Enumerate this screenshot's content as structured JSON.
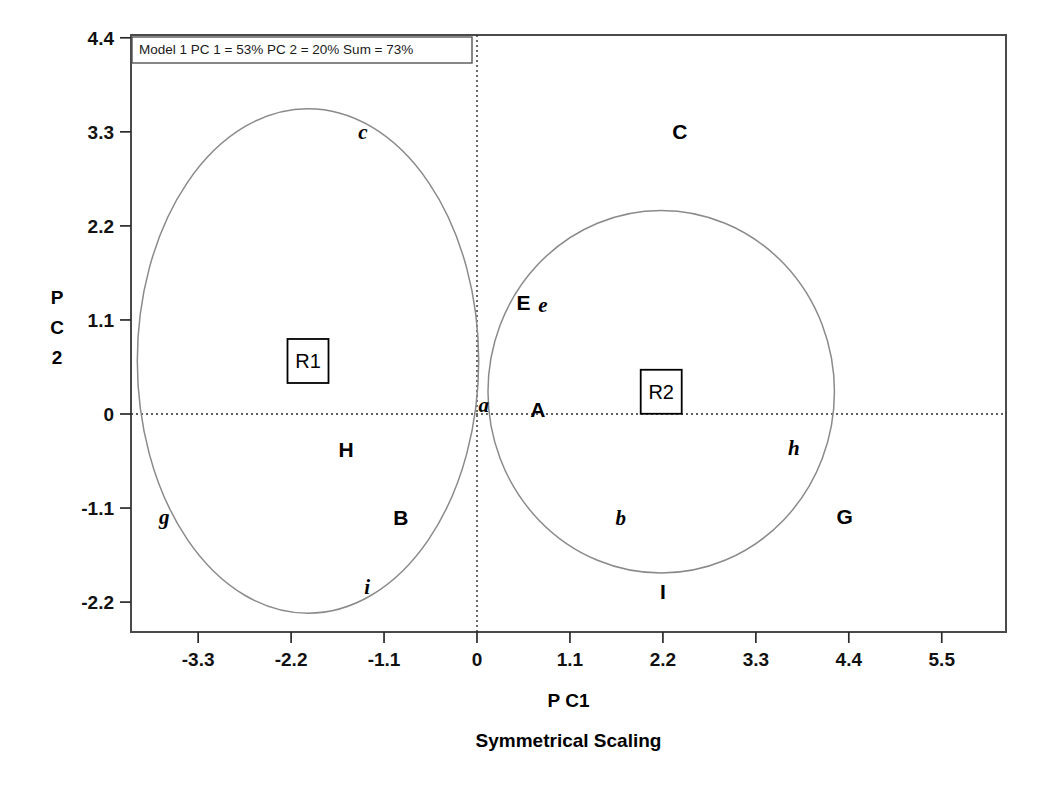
{
  "chart_data": {
    "type": "scatter",
    "title": "",
    "annotation": "Model 1 PC 1 = 53% PC 2 = 20% Sum = 73%",
    "xlabel": "P C1",
    "ylabel": "P C 2",
    "ylabel_chars": [
      "P",
      "C",
      "2"
    ],
    "caption": "Symmetrical Scaling",
    "xlim": [
      -4.0,
      6.0
    ],
    "ylim": [
      -2.55,
      4.4
    ],
    "xticks": [
      -3.3,
      -2.2,
      -1.1,
      0,
      1.1,
      2.2,
      3.3,
      4.4,
      5.5
    ],
    "xticklabels": [
      "-3.3",
      "-2.2",
      "-1.1",
      "0",
      "1.1",
      "2.2",
      "3.3",
      "4.4",
      "5.5"
    ],
    "yticks": [
      4.4,
      3.3,
      2.2,
      1.1,
      0,
      -1.1,
      -2.2
    ],
    "yticklabels": [
      "4.4",
      "3.3",
      "2.2",
      "1.1",
      "0",
      "-1.1",
      "-2.2"
    ],
    "grid": false,
    "legend": "none",
    "reference_lines": [
      {
        "axis": "x",
        "value": 0,
        "style": "dotted"
      },
      {
        "axis": "y",
        "value": 0,
        "style": "dotted"
      }
    ],
    "points": [
      {
        "label": "c",
        "x": -1.35,
        "y": 3.3,
        "style": "lower"
      },
      {
        "label": "C",
        "x": 2.4,
        "y": 3.3,
        "style": "upper"
      },
      {
        "label": "E",
        "x": 0.55,
        "y": 1.3,
        "style": "upper"
      },
      {
        "label": "e",
        "x": 0.78,
        "y": 1.28,
        "style": "lower"
      },
      {
        "label": "a",
        "x": 0.08,
        "y": 0.1,
        "style": "lower"
      },
      {
        "label": "A",
        "x": 0.72,
        "y": 0.05,
        "style": "upper"
      },
      {
        "label": "H",
        "x": -1.55,
        "y": -0.42,
        "style": "upper"
      },
      {
        "label": "h",
        "x": 3.75,
        "y": -0.4,
        "style": "lower"
      },
      {
        "label": "g",
        "x": -3.7,
        "y": -1.2,
        "style": "lower"
      },
      {
        "label": "B",
        "x": -0.9,
        "y": -1.22,
        "style": "upper"
      },
      {
        "label": "b",
        "x": 1.7,
        "y": -1.22,
        "style": "lower"
      },
      {
        "label": "G",
        "x": 4.35,
        "y": -1.2,
        "style": "upper"
      },
      {
        "label": "i",
        "x": -1.3,
        "y": -2.02,
        "style": "lower"
      },
      {
        "label": "I",
        "x": 2.2,
        "y": -2.08,
        "style": "upper"
      }
    ],
    "regions": [
      {
        "label": "R1",
        "cx": -2.0,
        "cy": 0.62,
        "rx": 2.02,
        "ry": 2.95
      },
      {
        "label": "R2",
        "cx": 2.18,
        "cy": 0.26,
        "rx": 2.05,
        "ry": 2.12
      }
    ]
  }
}
